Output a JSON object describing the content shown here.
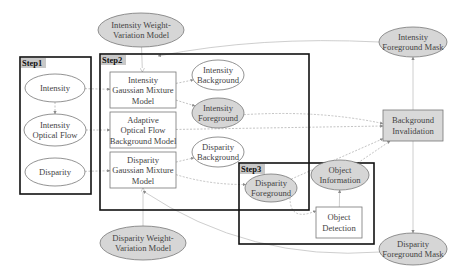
{
  "groups": [
    {
      "id": "step1",
      "label": "Step1"
    },
    {
      "id": "step2",
      "label": "Step2"
    },
    {
      "id": "step3",
      "label": "Step3"
    }
  ],
  "nodes": {
    "intensity": {
      "lines": [
        "Intensity"
      ],
      "shape": "ellipse",
      "shaded": false,
      "group": "step1"
    },
    "intensity_optical_flow": {
      "lines": [
        "Intensity",
        "Optical Flow"
      ],
      "shape": "ellipse",
      "shaded": false,
      "group": "step1"
    },
    "disparity": {
      "lines": [
        "Disparity"
      ],
      "shape": "ellipse",
      "shaded": false,
      "group": "step1"
    },
    "intensity_gmm": {
      "lines": [
        "Intensity",
        "Gaussian Mixture",
        "Model"
      ],
      "shape": "box",
      "shaded": false,
      "group": "step2"
    },
    "adaptive_of_bg_model": {
      "lines": [
        "Adaptive",
        "Optical Flow",
        "Background Model"
      ],
      "shape": "box",
      "shaded": false,
      "group": "step2"
    },
    "disparity_gmm": {
      "lines": [
        "Disparity",
        "Gaussian Mixture",
        "Model"
      ],
      "shape": "box",
      "shaded": false,
      "group": "step2"
    },
    "intensity_background": {
      "lines": [
        "Intensity",
        "Background"
      ],
      "shape": "ellipse",
      "shaded": false,
      "group": "step2"
    },
    "intensity_foreground": {
      "lines": [
        "Intensity",
        "Foreground"
      ],
      "shape": "ellipse",
      "shaded": true,
      "group": "step2"
    },
    "disparity_background": {
      "lines": [
        "Disparity",
        "Background"
      ],
      "shape": "ellipse",
      "shaded": false,
      "group": "step2"
    },
    "disparity_foreground": {
      "lines": [
        "Disparity",
        "Foreground"
      ],
      "shape": "ellipse",
      "shaded": true,
      "group": "step3"
    },
    "object_information": {
      "lines": [
        "Object",
        "Information"
      ],
      "shape": "ellipse",
      "shaded": true,
      "group": "step3"
    },
    "object_detection": {
      "lines": [
        "Object",
        "Detection"
      ],
      "shape": "box",
      "shaded": false,
      "group": "step3"
    },
    "intensity_weight_variation": {
      "lines": [
        "Intensity  Weight-",
        "Variation Model"
      ],
      "shape": "ellipse",
      "shaded": true,
      "group": null
    },
    "disparity_weight_variation": {
      "lines": [
        "Disparity Weight-",
        "Variation Model"
      ],
      "shape": "ellipse",
      "shaded": true,
      "group": null
    },
    "intensity_fg_mask": {
      "lines": [
        "Intensity",
        "Foreground Mask"
      ],
      "shape": "ellipse",
      "shaded": true,
      "group": null
    },
    "disparity_fg_mask": {
      "lines": [
        "Disparity",
        "Foreground Mask"
      ],
      "shape": "ellipse",
      "shaded": true,
      "group": null
    },
    "background_invalidation": {
      "lines": [
        "Background",
        "Invalidation"
      ],
      "shape": "box",
      "shaded": true,
      "group": null
    }
  },
  "edges": [
    {
      "from": "intensity",
      "to": "intensity_optical_flow",
      "style": "dashed"
    },
    {
      "from": "intensity",
      "to": "intensity_gmm",
      "style": "dashed"
    },
    {
      "from": "intensity_optical_flow",
      "to": "adaptive_of_bg_model",
      "style": "dashed"
    },
    {
      "from": "disparity",
      "to": "disparity_gmm",
      "style": "dashed"
    },
    {
      "from": "intensity_weight_variation",
      "to": "intensity_gmm",
      "style": "solid"
    },
    {
      "from": "disparity_weight_variation",
      "to": "disparity_gmm",
      "style": "solid"
    },
    {
      "from": "intensity_gmm",
      "to": "intensity_background",
      "style": "dashed"
    },
    {
      "from": "intensity_gmm",
      "to": "intensity_foreground",
      "style": "dashed"
    },
    {
      "from": "disparity_gmm",
      "to": "disparity_background",
      "style": "dashed"
    },
    {
      "from": "disparity_gmm",
      "to": "disparity_foreground",
      "style": "dashed"
    },
    {
      "from": "intensity_foreground",
      "to": "background_invalidation",
      "style": "dashed"
    },
    {
      "from": "adaptive_of_bg_model",
      "to": "background_invalidation",
      "style": "dashed"
    },
    {
      "from": "disparity_foreground",
      "to": "background_invalidation",
      "style": "dashed"
    },
    {
      "from": "disparity_foreground",
      "to": "object_detection",
      "style": "dashed"
    },
    {
      "from": "object_detection",
      "to": "object_information",
      "style": "solid"
    },
    {
      "from": "object_information",
      "to": "background_invalidation",
      "style": "dashed"
    },
    {
      "from": "background_invalidation",
      "to": "intensity_fg_mask",
      "style": "solid"
    },
    {
      "from": "background_invalidation",
      "to": "disparity_fg_mask",
      "style": "solid"
    },
    {
      "from": "intensity_fg_mask",
      "to": "intensity_gmm",
      "style": "solid"
    },
    {
      "from": "disparity_fg_mask",
      "to": "disparity_gmm",
      "style": "solid"
    },
    {
      "from": "object_information",
      "to": "intensity_fg_mask",
      "style": "dashed"
    },
    {
      "from": "intensity_weight_variation",
      "to": "intensity_fg_mask",
      "style": "dashed"
    }
  ]
}
